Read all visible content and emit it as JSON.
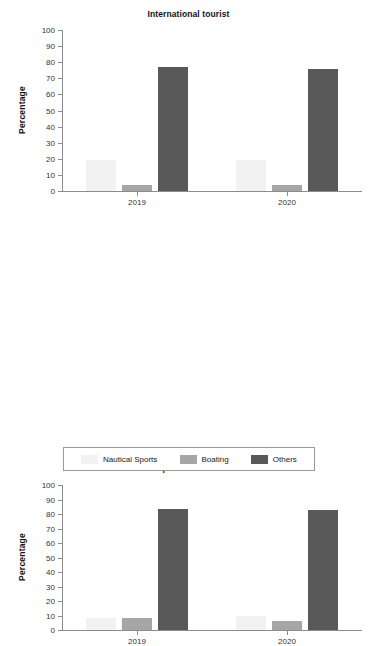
{
  "colors": {
    "nautical_sports": "#f2f2f2",
    "boating": "#a6a6a6",
    "others": "#595959",
    "axis": "#8c8c8c",
    "text": "#1a1a1a",
    "background": "#ffffff"
  },
  "legend": {
    "items": [
      {
        "label": "Nautical Sports",
        "color": "#f2f2f2"
      },
      {
        "label": "Boating",
        "color": "#a6a6a6"
      },
      {
        "label": "Others",
        "color": "#595959"
      }
    ]
  },
  "axis": {
    "y_ticks": [
      "100",
      "90",
      "80",
      "70",
      "60",
      "50",
      "40",
      "30",
      "20",
      "10",
      "0"
    ],
    "x_ticks": [
      "2019",
      "2020"
    ],
    "ylabel": "Percentage"
  },
  "chart_data": [
    {
      "type": "bar",
      "title": "International tourist",
      "xlabel": "",
      "ylabel": "Percentage",
      "ylim": [
        0,
        100
      ],
      "ytick_step": 10,
      "grid": false,
      "legend_position": "bottom",
      "categories": [
        "2019",
        "2020"
      ],
      "series": [
        {
          "name": "Nautical Sports",
          "color": "#f2f2f2",
          "values": [
            19,
            19.5
          ]
        },
        {
          "name": "Boating",
          "color": "#a6a6a6",
          "values": [
            4,
            3.5
          ]
        },
        {
          "name": "Others",
          "color": "#595959",
          "values": [
            77,
            76
          ]
        }
      ]
    },
    {
      "type": "bar",
      "title": "Spanish tourist",
      "xlabel": "",
      "ylabel": "Percentage",
      "ylim": [
        0,
        100
      ],
      "ytick_step": 10,
      "grid": false,
      "legend_position": "bottom",
      "categories": [
        "2019",
        "2020"
      ],
      "series": [
        {
          "name": "Nautical Sports",
          "color": "#f2f2f2",
          "values": [
            8.5,
            9.5
          ]
        },
        {
          "name": "Boating",
          "color": "#a6a6a6",
          "values": [
            8,
            6.5
          ]
        },
        {
          "name": "Others",
          "color": "#595959",
          "values": [
            83.5,
            82.5
          ]
        }
      ]
    }
  ]
}
